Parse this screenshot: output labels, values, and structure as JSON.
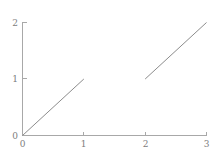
{
  "chart_data": {
    "type": "line",
    "title": "",
    "subtitle": "",
    "xlabel": "",
    "ylabel": "",
    "xlim": [
      0,
      3
    ],
    "ylim": [
      0,
      2
    ],
    "xticks": [
      0,
      1,
      2,
      3
    ],
    "yticks": [
      0,
      1,
      2
    ],
    "xtick_labels": [
      "0",
      "1",
      "2",
      "3"
    ],
    "ytick_labels": [
      "0",
      "1",
      "2"
    ],
    "grid": false,
    "legend": null,
    "annotations": [],
    "series": [
      {
        "name": "segment-1",
        "points": [
          [
            0,
            0
          ],
          [
            1,
            1
          ]
        ]
      },
      {
        "name": "segment-2",
        "points": [
          [
            2,
            1
          ],
          [
            3,
            2
          ]
        ]
      }
    ],
    "colors": {
      "line": "#8c8c8c",
      "axis": "#a8a8a8",
      "tick_label": "#7d7d7d",
      "background": "#ffffff"
    }
  },
  "axes": {
    "x": {
      "tick_0": "0",
      "tick_1": "1",
      "tick_2": "2",
      "tick_3": "3"
    },
    "y": {
      "tick_0": "0",
      "tick_1": "1",
      "tick_2": "2"
    }
  }
}
